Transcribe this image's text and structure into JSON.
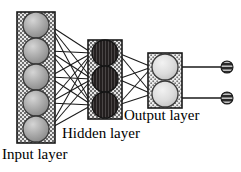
{
  "diagram": {
    "type": "feedforward-neural-network",
    "background_color": "#ffffff",
    "stroke_color": "#1a1a1a",
    "labels": {
      "input": "Input layer",
      "hidden": "Hidden layer",
      "output": "Output layer"
    },
    "layers": [
      {
        "id": "input",
        "name": "Input layer",
        "node_count": 5,
        "node_fill": "#a8a8a8",
        "box_fill": "#cfcfcf",
        "box": {
          "x": 17,
          "y": 12,
          "width": 38,
          "height": 131
        },
        "node_radius": 13,
        "node_centers_y": [
          25,
          51,
          77,
          103,
          129
        ],
        "node_center_x": 36
      },
      {
        "id": "hidden",
        "name": "Hidden layer",
        "node_count": 3,
        "node_fill": "#231f1f",
        "box_fill": "#cfcfcf",
        "box": {
          "x": 88,
          "y": 40,
          "width": 34,
          "height": 79
        },
        "node_radius": 13,
        "node_centers_y": [
          53,
          79,
          105
        ],
        "node_center_x": 105
      },
      {
        "id": "output",
        "name": "Output layer",
        "node_count": 2,
        "node_fill": "#d8d8d8",
        "box_fill": "#cfcfcf",
        "box": {
          "x": 148,
          "y": 53,
          "width": 34,
          "height": 55
        },
        "node_radius": 13,
        "node_centers_y": [
          67,
          94
        ],
        "node_center_x": 165
      }
    ],
    "terminals": {
      "count": 2,
      "fill": "#2b2b2b",
      "radius": 6,
      "center_x": 227,
      "centers_y": [
        67,
        98
      ],
      "lead_start_x": 182
    },
    "connections": [
      {
        "from": "input",
        "to": "hidden",
        "kind": "fully-connected",
        "count": 15
      },
      {
        "from": "hidden",
        "to": "output",
        "kind": "fully-connected",
        "count": 6
      },
      {
        "from": "output",
        "to": "terminals",
        "kind": "one-to-one",
        "count": 2
      }
    ]
  }
}
